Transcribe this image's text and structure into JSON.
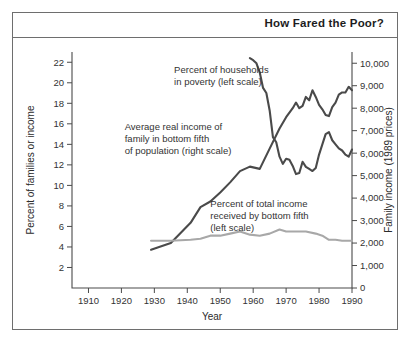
{
  "figure": {
    "title": "How Fared the Poor?"
  },
  "chart_data": {
    "type": "line",
    "title": "How Fared the Poor?",
    "xlabel": "Year",
    "ylabel": "Percent of families or income",
    "y2label": "Family income (1989 prices)",
    "xlim": [
      1905,
      1990
    ],
    "ylim": [
      0,
      23
    ],
    "y2lim": [
      0,
      10500
    ],
    "grid": false,
    "legend": "annotations-inline",
    "xticks": [
      1910,
      1920,
      1930,
      1940,
      1950,
      1960,
      1970,
      1980,
      1990
    ],
    "xtick_labels": [
      "1910",
      "1920",
      "1930",
      "1940",
      "1950",
      "1960",
      "1970",
      "1980",
      "1990"
    ],
    "yticks": [
      2,
      4,
      6,
      8,
      10,
      12,
      14,
      16,
      18,
      20,
      22
    ],
    "ytick_labels": [
      "2",
      "4",
      "6",
      "8",
      "10",
      "12",
      "14",
      "16",
      "18",
      "20",
      "22"
    ],
    "y2ticks": [
      0,
      1000,
      2000,
      3000,
      4000,
      5000,
      6000,
      7000,
      8000,
      9000,
      10000
    ],
    "y2tick_labels": [
      "0",
      "1,000",
      "2,000",
      "3,000",
      "4,000",
      "5,000",
      "6,000",
      "7,000",
      "8,000",
      "9,000",
      "10,000"
    ],
    "annotations": [
      {
        "name": "poverty-annotation",
        "lines": [
          "Percent of households",
          "in poverty (left scale)"
        ],
        "x": 1936,
        "y": 21.0
      },
      {
        "name": "income-annotation",
        "lines": [
          "Average real income of",
          "family in bottom fifth",
          "of population (right scale)"
        ],
        "x": 1921,
        "y": 15.4
      },
      {
        "name": "share-annotation",
        "lines": [
          "Percent of total income",
          "received by bottom fifth",
          "(left scale)"
        ],
        "x": 1947,
        "y": 7.9
      }
    ],
    "series": [
      {
        "name": "Percent of households in poverty (left scale)",
        "scale": "left",
        "color": "#4a4a4a",
        "x": [
          1959,
          1960,
          1961,
          1962,
          1963,
          1964,
          1965,
          1966,
          1967,
          1968,
          1969,
          1970,
          1971,
          1972,
          1973,
          1974,
          1975,
          1976,
          1977,
          1978,
          1979,
          1980,
          1981,
          1982,
          1983,
          1984,
          1985,
          1986,
          1987,
          1988,
          1989,
          1990
        ],
        "values": [
          22.4,
          22.2,
          21.9,
          21.0,
          19.5,
          19.0,
          17.3,
          14.7,
          14.2,
          12.8,
          12.1,
          12.6,
          12.5,
          11.9,
          11.1,
          11.2,
          12.3,
          11.8,
          11.6,
          11.4,
          11.7,
          13.0,
          14.0,
          15.0,
          15.2,
          14.4,
          14.0,
          13.6,
          13.4,
          13.0,
          12.8,
          13.5
        ]
      },
      {
        "name": "Average real income of family in bottom fifth of population (right scale)",
        "scale": "right",
        "color": "#4a4a4a",
        "x": [
          1929,
          1935,
          1941,
          1944,
          1947,
          1950,
          1953,
          1956,
          1959,
          1962,
          1965,
          1968,
          1970,
          1972,
          1973,
          1974,
          1975,
          1976,
          1977,
          1978,
          1979,
          1980,
          1981,
          1982,
          1983,
          1984,
          1985,
          1986,
          1987,
          1988,
          1989,
          1990
        ],
        "values": [
          1700,
          2000,
          2900,
          3600,
          3850,
          4250,
          4700,
          5200,
          5400,
          5300,
          6200,
          7100,
          7600,
          8000,
          8250,
          8000,
          8100,
          8500,
          8350,
          8800,
          8500,
          8150,
          7950,
          7700,
          7650,
          8050,
          8250,
          8600,
          8700,
          8700,
          8950,
          8800
        ]
      },
      {
        "name": "Percent of total income received by bottom fifth (left scale)",
        "scale": "left",
        "color": "#a8a8a8",
        "x": [
          1929,
          1935,
          1941,
          1944,
          1947,
          1950,
          1953,
          1956,
          1959,
          1962,
          1965,
          1968,
          1970,
          1973,
          1976,
          1979,
          1981,
          1983,
          1985,
          1987,
          1989,
          1990
        ],
        "values": [
          4.6,
          4.6,
          4.7,
          4.8,
          5.1,
          5.1,
          5.3,
          5.5,
          5.2,
          5.1,
          5.3,
          5.7,
          5.5,
          5.5,
          5.5,
          5.3,
          5.1,
          4.7,
          4.7,
          4.6,
          4.6,
          4.6
        ]
      }
    ]
  }
}
